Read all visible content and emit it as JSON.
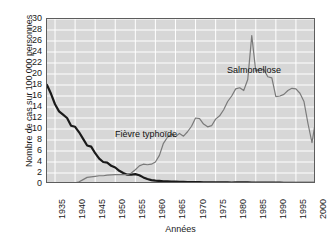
{
  "chart_data": {
    "type": "line",
    "title": "",
    "xlabel": "Années",
    "ylabel": "Nombre de cas sur 100 000 personnes",
    "xlim": [
      1933,
      2000
    ],
    "ylim": [
      0,
      30
    ],
    "ytick_step": 2,
    "xtick_step": 5,
    "grid": true,
    "grid_color": "#ffffff",
    "plot_background": "#d7d7d7",
    "legend_position": "inline-annotations",
    "yticks": [
      30,
      28,
      26,
      24,
      22,
      20,
      18,
      16,
      14,
      12,
      10,
      8,
      6,
      4,
      2,
      0
    ],
    "xticks": [
      1935,
      1940,
      1945,
      1950,
      1955,
      1960,
      1965,
      1970,
      1975,
      1980,
      1985,
      1990,
      1995,
      2000
    ],
    "annotations": [
      {
        "text": "Fièvre typhoïde",
        "x": 1946,
        "y": 11.5
      },
      {
        "text": "Salmonellose",
        "x": 1973,
        "y": 23.5
      }
    ],
    "series": [
      {
        "name": "Fièvre typhoïde",
        "color": "#1a1a1a",
        "width": 2.2,
        "x": [
          1933,
          1934,
          1935,
          1936,
          1937,
          1938,
          1939,
          1940,
          1941,
          1942,
          1943,
          1944,
          1945,
          1946,
          1947,
          1948,
          1949,
          1950,
          1951,
          1952,
          1953,
          1954,
          1955,
          1956,
          1957,
          1958,
          1959,
          1960,
          1961,
          1962,
          1963,
          1964,
          1965,
          1966,
          1967,
          1968,
          1969,
          1970,
          1971,
          1972,
          1973,
          1974,
          1975,
          1976,
          1977,
          1978,
          1979,
          1980,
          1981,
          1982,
          1983,
          1984,
          1985,
          1986,
          1987,
          1988,
          1989,
          1990,
          1991,
          1992,
          1993,
          1994,
          1995,
          1996,
          1997,
          1998,
          1999,
          2000
        ],
        "y": [
          18.0,
          16.4,
          14.5,
          13.2,
          12.6,
          12.0,
          10.6,
          10.4,
          9.4,
          8.2,
          7.0,
          6.8,
          5.6,
          4.6,
          4.0,
          3.9,
          3.3,
          3.0,
          2.4,
          2.0,
          1.7,
          1.7,
          1.8,
          1.6,
          1.2,
          0.9,
          0.7,
          0.6,
          0.55,
          0.5,
          0.48,
          0.45,
          0.42,
          0.4,
          0.38,
          0.36,
          0.35,
          0.34,
          0.33,
          0.32,
          0.31,
          0.3,
          0.3,
          0.29,
          0.28,
          0.28,
          0.27,
          0.3,
          0.32,
          0.3,
          0.28,
          0.27,
          0.26,
          0.26,
          0.25,
          0.25,
          0.25,
          0.24,
          0.24,
          0.23,
          0.23,
          0.22,
          0.22,
          0.22,
          0.21,
          0.21,
          0.2,
          0.2
        ]
      },
      {
        "name": "Salmonellose",
        "color": "#7a7a7a",
        "width": 1.2,
        "x": [
          1933,
          1934,
          1935,
          1936,
          1937,
          1938,
          1939,
          1940,
          1941,
          1942,
          1943,
          1944,
          1945,
          1946,
          1947,
          1948,
          1949,
          1950,
          1951,
          1952,
          1953,
          1954,
          1955,
          1956,
          1957,
          1958,
          1959,
          1960,
          1961,
          1962,
          1963,
          1964,
          1965,
          1966,
          1967,
          1968,
          1969,
          1970,
          1971,
          1972,
          1973,
          1974,
          1975,
          1976,
          1977,
          1978,
          1979,
          1980,
          1981,
          1982,
          1983,
          1984,
          1985,
          1986,
          1987,
          1988,
          1989,
          1990,
          1991,
          1992,
          1993,
          1994,
          1995,
          1996,
          1997,
          1998,
          1999,
          2000
        ],
        "y": [
          0.1,
          0.1,
          0.1,
          0.1,
          0.1,
          0.1,
          0.15,
          0.2,
          0.4,
          0.8,
          1.2,
          1.3,
          1.4,
          1.5,
          1.5,
          1.6,
          1.65,
          1.7,
          1.7,
          1.7,
          1.7,
          2.0,
          2.6,
          3.3,
          3.6,
          3.5,
          3.6,
          4.0,
          5.2,
          7.4,
          8.5,
          9.1,
          8.6,
          9.2,
          8.7,
          9.5,
          10.5,
          12.0,
          11.9,
          10.9,
          10.4,
          10.6,
          11.8,
          12.4,
          13.5,
          15.0,
          16.0,
          17.3,
          17.5,
          17.0,
          19.0,
          27.0,
          20.5,
          21.0,
          20.8,
          19.5,
          19.3,
          15.9,
          16.0,
          16.3,
          17.0,
          17.4,
          17.3,
          16.5,
          15.0,
          11.0,
          7.5,
          12.0
        ]
      }
    ]
  }
}
